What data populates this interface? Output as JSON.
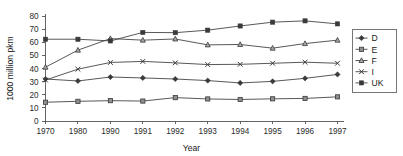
{
  "chart_data": {
    "type": "line",
    "title": "",
    "xlabel": "Year",
    "ylabel": "1000 million pkm",
    "categories": [
      "1970",
      "1980",
      "1990",
      "1991",
      "1992",
      "1993",
      "1994",
      "1995",
      "1996",
      "1997"
    ],
    "ylim": [
      0,
      80
    ],
    "ytick_step": 10,
    "yticks": [
      "0",
      "10",
      "20",
      "30",
      "40",
      "50",
      "60",
      "70",
      "80"
    ],
    "grid": false,
    "legend_position": "right",
    "series": [
      {
        "name": "D",
        "marker": "diamond",
        "color": "#3a3a3a",
        "values": [
          32.0,
          30.5,
          33.5,
          32.8,
          32.0,
          30.8,
          29.0,
          30.2,
          32.5,
          35.5
        ]
      },
      {
        "name": "E",
        "marker": "square",
        "color": "#3a3a3a",
        "values": [
          14.3,
          15.0,
          15.5,
          15.2,
          17.8,
          16.8,
          16.4,
          16.9,
          17.2,
          18.4
        ]
      },
      {
        "name": "F",
        "marker": "triangle",
        "color": "#3a3a3a",
        "values": [
          41.0,
          54.0,
          62.8,
          61.6,
          62.5,
          58.0,
          58.3,
          55.5,
          59.0,
          61.6
        ]
      },
      {
        "name": "I",
        "marker": "cross",
        "color": "#3a3a3a",
        "values": [
          31.2,
          39.5,
          44.6,
          45.4,
          44.3,
          43.0,
          43.2,
          44.0,
          44.8,
          44.0
        ]
      },
      {
        "name": "UK",
        "marker": "square-filled",
        "color": "#3a3a3a",
        "values": [
          62.3,
          62.3,
          61.0,
          67.5,
          67.3,
          69.2,
          72.4,
          75.3,
          76.3,
          74.0
        ]
      }
    ]
  },
  "legend": {
    "entries": [
      "D",
      "E",
      "F",
      "I",
      "UK"
    ]
  },
  "axes": {
    "x_title": "Year",
    "y_title": "1000 million pkm"
  }
}
